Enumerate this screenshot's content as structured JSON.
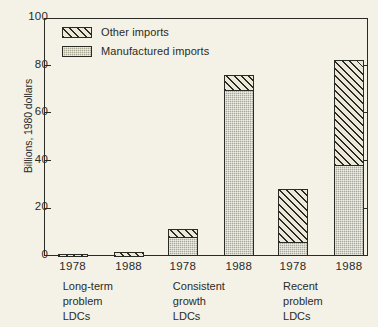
{
  "chart_data": {
    "type": "bar",
    "subtype": "stacked-grouped-bar",
    "title": "",
    "xlabel": "",
    "ylabel": "Billions, 1980 dollars",
    "ylim": [
      0,
      100
    ],
    "yticks": [
      0,
      20,
      40,
      60,
      80,
      100
    ],
    "ytick_labels": [
      "0",
      "20",
      "40",
      "60",
      "80",
      "100"
    ],
    "grid": false,
    "legend_position": "top-left",
    "legend": [
      {
        "name": "Other imports",
        "pattern": "diagonal-hatch",
        "color": "#ece9d8"
      },
      {
        "name": "Manufactured imports",
        "pattern": "stipple",
        "color": "#a9a894"
      }
    ],
    "groups": [
      {
        "label_lines": [
          "Long-term",
          "problem",
          "LDCs"
        ],
        "bars": [
          {
            "year": "1978",
            "manufactured": 0.3,
            "other": 0.7,
            "total": 1.0
          },
          {
            "year": "1988",
            "manufactured": 0.3,
            "other": 1.2,
            "total": 1.5
          }
        ]
      },
      {
        "label_lines": [
          "Consistent",
          "growth",
          "LDCs"
        ],
        "bars": [
          {
            "year": "1978",
            "manufactured": 8.0,
            "other": 3.5,
            "total": 11.5
          },
          {
            "year": "1988",
            "manufactured": 70.0,
            "other": 6.0,
            "total": 76.0
          }
        ]
      },
      {
        "label_lines": [
          "Recent",
          "problem",
          "LDCs"
        ],
        "bars": [
          {
            "year": "1978",
            "manufactured": 6.0,
            "other": 22.0,
            "total": 28.0
          },
          {
            "year": "1988",
            "manufactured": 38.5,
            "other": 44.0,
            "total": 82.5
          }
        ]
      }
    ],
    "series": [
      {
        "name": "Manufactured imports",
        "values": [
          0.3,
          0.3,
          8.0,
          70.0,
          6.0,
          38.5
        ]
      },
      {
        "name": "Other imports",
        "values": [
          0.7,
          1.2,
          3.5,
          6.0,
          22.0,
          44.0
        ]
      }
    ],
    "categories": [
      "Long-term problem LDCs 1978",
      "Long-term problem LDCs 1988",
      "Consistent growth LDCs 1978",
      "Consistent growth LDCs 1988",
      "Recent problem LDCs 1978",
      "Recent problem LDCs 1988"
    ],
    "colors": {
      "ink": "#2b2b26",
      "background": "#f4f2e6",
      "manufactured_fill": "#a9a894",
      "other_fill": "#ece9d8"
    }
  }
}
